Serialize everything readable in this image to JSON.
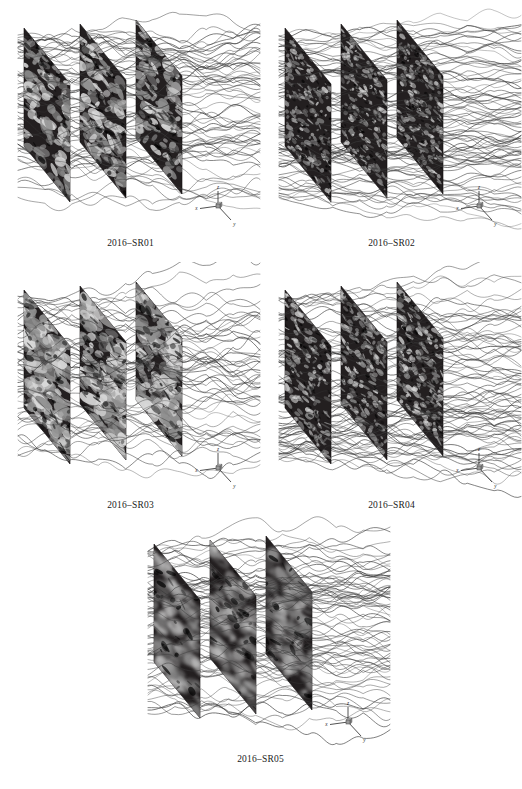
{
  "figure": {
    "background_color": "#ffffff",
    "plane_fill_color": "#231f20",
    "plane_edge_color": "#100e0f",
    "blob_light_color": "#d9d9d9",
    "blob_mid_color": "#8f8f8f",
    "streamline_color": "#3a3a3a",
    "caption_color": "#1a1a1a",
    "axis_color": "#262626",
    "axis_cube_color": "#9a9a9a",
    "bottom_caption": "",
    "panels": [
      {
        "id": "panel-sr01",
        "caption": "2016–SR01",
        "x": 0,
        "y": 0,
        "texture": "coarse-elongated",
        "blob_count": 120,
        "blob_scale": 1.25,
        "blob_opacity": 0.92,
        "streamline_count": 26,
        "streamline_amplitude": 1.25,
        "seed": 101,
        "axis": {
          "z_label": "z",
          "x_label": "x",
          "y_label": "y"
        }
      },
      {
        "id": "panel-sr02",
        "caption": "2016–SR02",
        "x": 261,
        "y": 0,
        "texture": "fine-speckle",
        "blob_count": 210,
        "blob_scale": 0.6,
        "blob_opacity": 0.8,
        "streamline_count": 34,
        "streamline_amplitude": 0.95,
        "seed": 202,
        "axis": {
          "z_label": "z",
          "x_label": "x",
          "y_label": "y"
        }
      },
      {
        "id": "panel-sr03",
        "caption": "2016–SR03",
        "x": 0,
        "y": 262,
        "texture": "dense-large",
        "blob_count": 165,
        "blob_scale": 1.55,
        "blob_opacity": 0.97,
        "streamline_count": 22,
        "streamline_amplitude": 1.45,
        "seed": 303,
        "axis": {
          "z_label": "z",
          "x_label": "x",
          "y_label": "y"
        }
      },
      {
        "id": "panel-sr04",
        "caption": "2016–SR04",
        "x": 261,
        "y": 262,
        "texture": "fine-streaky",
        "blob_count": 190,
        "blob_scale": 0.72,
        "blob_opacity": 0.82,
        "streamline_count": 32,
        "streamline_amplitude": 1.15,
        "seed": 404,
        "axis": {
          "z_label": "z",
          "x_label": "x",
          "y_label": "y"
        }
      },
      {
        "id": "panel-sr05",
        "caption": "2016–SR05",
        "x": 130,
        "y": 516,
        "texture": "diffuse-glow",
        "blob_count": 95,
        "blob_scale": 1.7,
        "blob_opacity": 0.85,
        "streamline_count": 30,
        "streamline_amplitude": 1.2,
        "seed": 505,
        "axis": {
          "z_label": "z",
          "x_label": "x",
          "y_label": "y"
        }
      }
    ],
    "geometry": {
      "plane_width": 62,
      "plane_height": 118,
      "plane_skew_x": 46,
      "plane_skew_y": 56,
      "plane_gap_x": 56,
      "plane_gap_y": -4,
      "origin_x": 24,
      "origin_y": 28,
      "caption_offset_y": 238
    }
  }
}
